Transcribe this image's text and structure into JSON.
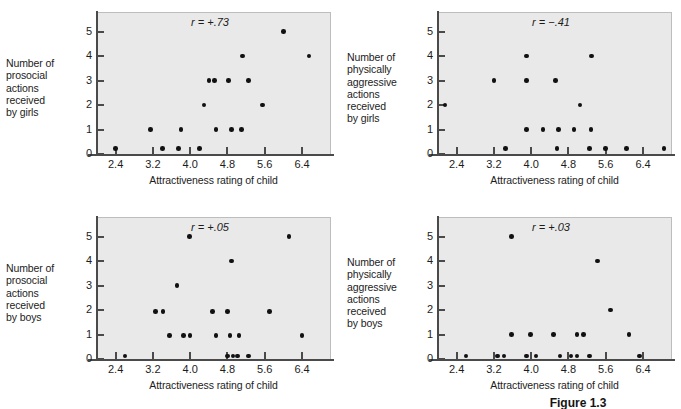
{
  "figure": {
    "caption": "Figure 1.3",
    "xaxis_title": "Attractiveness rating of child",
    "x_ticks": [
      "2.4",
      "3.2",
      "4.0",
      "4.8",
      "5.6",
      "6.4"
    ],
    "y_ticks": [
      "0",
      "1",
      "2",
      "3",
      "4",
      "5"
    ]
  },
  "chart_data": [
    {
      "type": "scatter",
      "title": "",
      "annotation": "r = +.73",
      "r_value": 0.73,
      "xlabel": "Attractiveness rating of child",
      "ylabel": "Number of prosocial actions received by girls",
      "ylabel_lines": "Number of\nprosocial\nactions\nreceived\nby girls",
      "xlim": [
        2.0,
        7.0
      ],
      "ylim": [
        0,
        5.8
      ],
      "xticks": [
        2.4,
        3.2,
        4.0,
        4.8,
        5.6,
        6.4
      ],
      "yticks": [
        0,
        1,
        2,
        3,
        4,
        5
      ],
      "grid": false,
      "legend": "none",
      "points": [
        {
          "x": 2.4,
          "y": 0.22
        },
        {
          "x": 3.4,
          "y": 0.22
        },
        {
          "x": 3.75,
          "y": 0.22
        },
        {
          "x": 4.2,
          "y": 0.22
        },
        {
          "x": 3.15,
          "y": 1.0
        },
        {
          "x": 3.8,
          "y": 1.0
        },
        {
          "x": 4.55,
          "y": 1.0
        },
        {
          "x": 4.88,
          "y": 1.0
        },
        {
          "x": 5.1,
          "y": 1.0
        },
        {
          "x": 4.3,
          "y": 2.0
        },
        {
          "x": 5.55,
          "y": 2.0
        },
        {
          "x": 4.4,
          "y": 3.0
        },
        {
          "x": 4.52,
          "y": 3.0
        },
        {
          "x": 4.82,
          "y": 3.0
        },
        {
          "x": 5.25,
          "y": 3.0
        },
        {
          "x": 5.12,
          "y": 4.0
        },
        {
          "x": 6.55,
          "y": 4.0
        },
        {
          "x": 6.0,
          "y": 5.0
        }
      ]
    },
    {
      "type": "scatter",
      "title": "",
      "annotation": "r = −.41",
      "r_value": -0.41,
      "xlabel": "Attractiveness rating of child",
      "ylabel": "Number of physically aggressive actions received by girls",
      "ylabel_lines": "Number of\nphysically\naggressive\nactions\nreceived\nby girls",
      "xlim": [
        2.0,
        7.0
      ],
      "ylim": [
        0,
        5.8
      ],
      "xticks": [
        2.4,
        3.2,
        4.0,
        4.8,
        5.6,
        6.4
      ],
      "yticks": [
        0,
        1,
        2,
        3,
        4,
        5
      ],
      "grid": false,
      "legend": "none",
      "points": [
        {
          "x": 3.45,
          "y": 0.22
        },
        {
          "x": 4.55,
          "y": 0.22
        },
        {
          "x": 5.25,
          "y": 0.22
        },
        {
          "x": 5.6,
          "y": 0.22
        },
        {
          "x": 6.05,
          "y": 0.22
        },
        {
          "x": 6.85,
          "y": 0.22
        },
        {
          "x": 3.9,
          "y": 1.0
        },
        {
          "x": 4.25,
          "y": 1.0
        },
        {
          "x": 4.58,
          "y": 1.0
        },
        {
          "x": 4.92,
          "y": 1.0
        },
        {
          "x": 5.28,
          "y": 1.0
        },
        {
          "x": 2.15,
          "y": 2.0
        },
        {
          "x": 5.05,
          "y": 2.0
        },
        {
          "x": 3.2,
          "y": 3.0
        },
        {
          "x": 3.9,
          "y": 3.0
        },
        {
          "x": 4.52,
          "y": 3.0
        },
        {
          "x": 3.9,
          "y": 4.0
        },
        {
          "x": 5.3,
          "y": 4.0
        }
      ]
    },
    {
      "type": "scatter",
      "title": "",
      "annotation": "r = +.05",
      "r_value": 0.05,
      "xlabel": "Attractiveness rating of child",
      "ylabel": "Number of prosocial actions received by boys",
      "ylabel_lines": "Number of\nprosocial\nactions\nreceived\nby boys",
      "xlim": [
        2.0,
        7.0
      ],
      "ylim": [
        0,
        5.8
      ],
      "xticks": [
        2.4,
        3.2,
        4.0,
        4.8,
        5.6,
        6.4
      ],
      "yticks": [
        0,
        1,
        2,
        3,
        4,
        5
      ],
      "grid": false,
      "legend": "none",
      "points": [
        {
          "x": 2.6,
          "y": 0.12
        },
        {
          "x": 4.8,
          "y": 0.12
        },
        {
          "x": 4.92,
          "y": 0.12
        },
        {
          "x": 5.02,
          "y": 0.12
        },
        {
          "x": 5.25,
          "y": 0.12
        },
        {
          "x": 3.55,
          "y": 0.95
        },
        {
          "x": 3.85,
          "y": 0.95
        },
        {
          "x": 4.0,
          "y": 0.95
        },
        {
          "x": 4.55,
          "y": 0.95
        },
        {
          "x": 4.85,
          "y": 0.95
        },
        {
          "x": 5.05,
          "y": 0.95
        },
        {
          "x": 6.4,
          "y": 0.95
        },
        {
          "x": 3.25,
          "y": 1.95
        },
        {
          "x": 3.42,
          "y": 1.95
        },
        {
          "x": 4.48,
          "y": 1.95
        },
        {
          "x": 4.8,
          "y": 1.95
        },
        {
          "x": 5.7,
          "y": 1.95
        },
        {
          "x": 3.72,
          "y": 3.0
        },
        {
          "x": 4.88,
          "y": 4.0
        },
        {
          "x": 3.98,
          "y": 5.0
        },
        {
          "x": 6.12,
          "y": 5.0
        }
      ]
    },
    {
      "type": "scatter",
      "title": "",
      "annotation": "r = +.03",
      "r_value": 0.03,
      "xlabel": "Attractiveness rating of child",
      "ylabel": "Number of physically aggressive actions received by boys",
      "ylabel_lines": "Number of\nphysically\naggressive\nactions\nreceived\nby boys",
      "xlim": [
        2.0,
        7.0
      ],
      "ylim": [
        0,
        5.8
      ],
      "xticks": [
        2.4,
        3.2,
        4.0,
        4.8,
        5.6,
        6.4
      ],
      "yticks": [
        0,
        1,
        2,
        3,
        4,
        5
      ],
      "grid": false,
      "legend": "none",
      "points": [
        {
          "x": 2.6,
          "y": 0.12
        },
        {
          "x": 3.28,
          "y": 0.12
        },
        {
          "x": 3.42,
          "y": 0.12
        },
        {
          "x": 3.9,
          "y": 0.12
        },
        {
          "x": 4.1,
          "y": 0.12
        },
        {
          "x": 4.62,
          "y": 0.12
        },
        {
          "x": 4.85,
          "y": 0.12
        },
        {
          "x": 4.98,
          "y": 0.12
        },
        {
          "x": 5.25,
          "y": 0.12
        },
        {
          "x": 6.32,
          "y": 0.12
        },
        {
          "x": 3.58,
          "y": 1.0
        },
        {
          "x": 3.98,
          "y": 1.0
        },
        {
          "x": 4.48,
          "y": 1.0
        },
        {
          "x": 4.98,
          "y": 1.0
        },
        {
          "x": 5.12,
          "y": 1.0
        },
        {
          "x": 6.1,
          "y": 1.0
        },
        {
          "x": 5.7,
          "y": 2.0
        },
        {
          "x": 5.42,
          "y": 4.0
        },
        {
          "x": 3.58,
          "y": 5.0
        }
      ]
    }
  ]
}
